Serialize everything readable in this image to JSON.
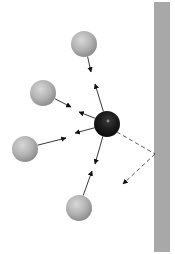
{
  "diagram": {
    "type": "molecular-interaction",
    "canvas": {
      "width": 175,
      "height": 254,
      "background": "#ffffff"
    },
    "wall": {
      "x": 154,
      "y": 2,
      "width": 16,
      "height": 250,
      "color": "#a8a8a8"
    },
    "central_sphere": {
      "cx": 107,
      "cy": 124,
      "r": 13,
      "color": "#1a1a1a",
      "highlight": "#8a8a8a"
    },
    "neighbor_spheres": [
      {
        "id": "top",
        "cx": 84,
        "cy": 44,
        "r": 13,
        "color": "#b4b4b4"
      },
      {
        "id": "upper-left",
        "cx": 43,
        "cy": 93,
        "r": 13,
        "color": "#b4b4b4"
      },
      {
        "id": "lower-left",
        "cx": 25,
        "cy": 149,
        "r": 13,
        "color": "#b4b4b4"
      },
      {
        "id": "bottom",
        "cx": 79,
        "cy": 208,
        "r": 13,
        "color": "#b4b4b4"
      }
    ],
    "arrow_pairs": [
      {
        "to": "top",
        "head_toward_neighbor": [
          95,
          84
        ],
        "head_toward_center": [
          91,
          72
        ]
      },
      {
        "to": "upper-left",
        "head_toward_neighbor": [
          79,
          112
        ],
        "head_toward_center": [
          71,
          107
        ]
      },
      {
        "to": "lower-left",
        "head_toward_neighbor": [
          66,
          138
        ],
        "head_toward_center": [
          75,
          133
        ]
      },
      {
        "to": "bottom",
        "head_toward_neighbor": [
          95,
          164
        ],
        "head_toward_center": [
          92,
          171
        ]
      }
    ],
    "reflection": {
      "style": "dashed",
      "start": [
        117,
        132
      ],
      "wall_hit": [
        155,
        154
      ],
      "end": [
        123,
        184
      ],
      "color": "#444444"
    },
    "line_color": "#222222"
  }
}
